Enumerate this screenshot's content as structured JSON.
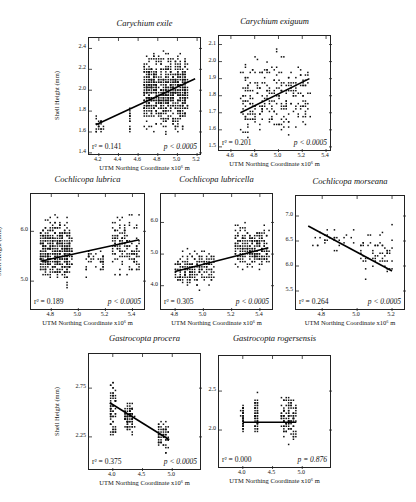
{
  "figure": {
    "y_axis_label": "Shell Height (mm)",
    "x_axis_label": "UTM Northing Coordinate x10⁶ m"
  },
  "chart_data": [
    {
      "type": "scatter",
      "title": "Carychium exile",
      "xlabel": "UTM Northing Coordinate x10⁶ m",
      "ylabel": "Shell Height (mm)",
      "xticks": [
        4.2,
        4.4,
        4.6,
        4.8,
        5.0,
        5.2
      ],
      "yticks": [
        1.4,
        1.6,
        1.8,
        2.0,
        2.2,
        2.4
      ],
      "xlim": [
        4.1,
        5.25
      ],
      "ylim": [
        1.37,
        2.5
      ],
      "regression": {
        "x": [
          4.17,
          5.18
        ],
        "y": [
          1.67,
          2.11
        ]
      },
      "clusters": [
        {
          "x": [
            4.15,
            4.25
          ],
          "y": [
            1.52,
            1.8
          ],
          "n": 22
        },
        {
          "x": [
            4.52,
            4.53
          ],
          "y": [
            1.52,
            1.88
          ],
          "n": 14
        },
        {
          "x": [
            4.65,
            5.1
          ],
          "y": [
            1.52,
            2.45
          ],
          "n": 700
        }
      ],
      "r2_label": "r² = 0.141",
      "p_label": "p < 0.0005"
    },
    {
      "type": "scatter",
      "title": "Carychium exiguum",
      "xlabel": "UTM Northing Coordinate x10⁶ m",
      "ylabel": "",
      "xticks": [
        4.6,
        4.8,
        5.0,
        5.2,
        5.4
      ],
      "yticks": [
        1.5,
        1.6,
        1.7,
        1.8,
        1.9,
        2.0,
        2.1
      ],
      "xlim": [
        4.5,
        5.45
      ],
      "ylim": [
        1.47,
        2.15
      ],
      "regression": {
        "x": [
          4.68,
          5.26
        ],
        "y": [
          1.7,
          1.9
        ]
      },
      "clusters": [
        {
          "x": [
            4.68,
            5.26
          ],
          "y": [
            1.47,
            2.11
          ],
          "n": 260
        }
      ],
      "r2_label": "r² = 0.201",
      "p_label": "p < 0.0005"
    },
    {
      "type": "scatter",
      "title": "Cochlicopa lubrica",
      "xlabel": "UTM Northing Coordinate x10⁶ m",
      "ylabel": "Shell Height (mm)",
      "xticks": [
        4.8,
        5.0,
        5.2,
        5.4
      ],
      "yticks": [
        5.0,
        6.0
      ],
      "xlim": [
        4.65,
        5.5
      ],
      "ylim": [
        4.4,
        6.75
      ],
      "regression": {
        "x": [
          4.72,
          5.45
        ],
        "y": [
          5.4,
          5.83
        ]
      },
      "clusters": [
        {
          "x": [
            4.72,
            4.95
          ],
          "y": [
            4.75,
            6.5
          ],
          "n": 420
        },
        {
          "x": [
            5.05,
            5.2
          ],
          "y": [
            5.0,
            5.8
          ],
          "n": 40
        },
        {
          "x": [
            5.25,
            5.45
          ],
          "y": [
            4.9,
            6.5
          ],
          "n": 140
        }
      ],
      "r2_label": "r² = 0.189",
      "p_label": "p < 0.0005"
    },
    {
      "type": "scatter",
      "title": "Cochlicopa lubricella",
      "xlabel": "UTM Northing Coordinate x10⁶ m",
      "ylabel": "",
      "xticks": [
        4.8,
        5.0,
        5.2,
        5.4
      ],
      "yticks": [
        4.0,
        5.0,
        6.0
      ],
      "xlim": [
        4.7,
        5.5
      ],
      "ylim": [
        3.2,
        6.9
      ],
      "regression": {
        "x": [
          4.8,
          5.46
        ],
        "y": [
          4.45,
          5.2
        ]
      },
      "clusters": [
        {
          "x": [
            4.8,
            5.08
          ],
          "y": [
            3.8,
            5.35
          ],
          "n": 180
        },
        {
          "x": [
            5.22,
            5.46
          ],
          "y": [
            4.3,
            6.1
          ],
          "n": 220
        }
      ],
      "r2_label": "r² = 0.305",
      "p_label": "p < 0.0005"
    },
    {
      "type": "scatter",
      "title": "Cochlicopa morseana",
      "xlabel": "UTM Northing Coordinate x10⁶ m",
      "ylabel": "",
      "xticks": [
        4.8,
        5.0,
        5.2
      ],
      "yticks": [
        5.5,
        6.0,
        6.5,
        7.0
      ],
      "xlim": [
        4.65,
        5.28
      ],
      "ylim": [
        5.1,
        7.4
      ],
      "regression": {
        "x": [
          4.72,
          5.2
        ],
        "y": [
          6.8,
          5.9
        ]
      },
      "clusters": [
        {
          "x": [
            4.74,
            5.0
          ],
          "y": [
            6.0,
            6.95
          ],
          "n": 30
        },
        {
          "x": [
            5.02,
            5.2
          ],
          "y": [
            5.6,
            6.95
          ],
          "n": 60
        }
      ],
      "r2_label": "r² = 0.264",
      "p_label": "p < 0.0005"
    },
    {
      "type": "scatter",
      "title": "Gastrocopta procera",
      "xlabel": "UTM Northing Coordinate x10⁶ m",
      "ylabel": "Shell Height (mm)",
      "xticks": [
        4.0,
        4.5,
        5.0
      ],
      "yticks": [
        2.25,
        2.75
      ],
      "xlim": [
        3.6,
        5.5
      ],
      "ylim": [
        1.9,
        3.1
      ],
      "regression": {
        "x": [
          3.95,
          4.95
        ],
        "y": [
          2.6,
          2.22
        ]
      },
      "clusters": [
        {
          "x": [
            3.95,
            4.05
          ],
          "y": [
            2.15,
            2.92
          ],
          "n": 70
        },
        {
          "x": [
            4.2,
            4.35
          ],
          "y": [
            2.2,
            2.7
          ],
          "n": 90
        },
        {
          "x": [
            4.75,
            4.95
          ],
          "y": [
            2.05,
            2.5
          ],
          "n": 60
        }
      ],
      "r2_label": "r² = 0.375",
      "p_label": "p < 0.0005"
    },
    {
      "type": "scatter",
      "title": "Gastrocopta rogersensis",
      "xlabel": "UTM Northing Coordinate x10⁶ m",
      "ylabel": "",
      "xticks": [
        4.0,
        4.5,
        5.0
      ],
      "yticks": [
        2.0,
        2.5
      ],
      "xlim": [
        3.6,
        5.5
      ],
      "ylim": [
        1.5,
        2.95
      ],
      "regression": {
        "x": [
          4.0,
          4.9
        ],
        "y": [
          2.1,
          2.1
        ]
      },
      "clusters": [
        {
          "x": [
            3.98,
            4.02
          ],
          "y": [
            1.8,
            2.48
          ],
          "n": 45
        },
        {
          "x": [
            4.2,
            4.26
          ],
          "y": [
            1.85,
            2.55
          ],
          "n": 50
        },
        {
          "x": [
            4.65,
            4.9
          ],
          "y": [
            1.75,
            2.58
          ],
          "n": 110
        }
      ],
      "r2_label": "r² = 0.000",
      "p_label": "p = 0.876"
    }
  ]
}
